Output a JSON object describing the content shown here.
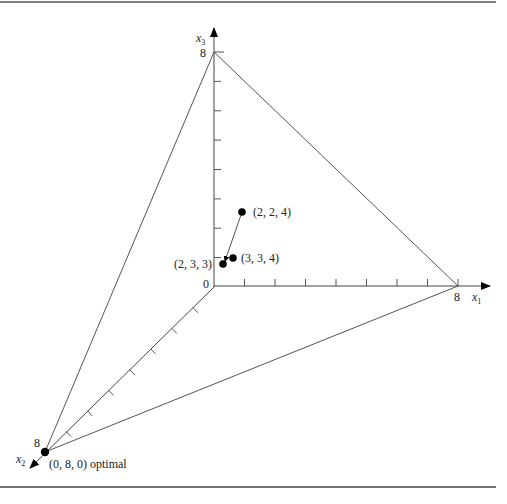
{
  "figure": {
    "axes": {
      "x1": {
        "label": "x",
        "subscript": "1",
        "max_label": "8"
      },
      "x2": {
        "label": "x",
        "subscript": "2",
        "max_label": "8"
      },
      "x3": {
        "label": "x",
        "subscript": "3",
        "max_label": "8"
      },
      "origin_label": "0"
    },
    "points": [
      {
        "label": "(2, 2, 4)"
      },
      {
        "label": "(3, 3, 4)"
      },
      {
        "label": "(2, 3, 3)"
      },
      {
        "label": "(0, 8, 0) optimal"
      }
    ],
    "colors": {
      "line": "#555555",
      "point": "#000000",
      "border": "#444444"
    }
  }
}
